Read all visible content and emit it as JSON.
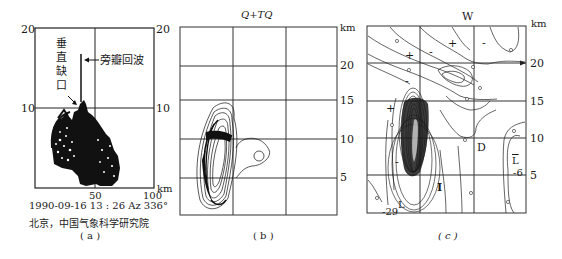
{
  "figure": {
    "panels": [
      {
        "id": "a",
        "caption": "( a )",
        "y_ticks_left": [
          "20",
          "10"
        ],
        "y_ticks_right": [
          "20",
          "10"
        ],
        "x_ticks": [
          "50",
          "100"
        ],
        "unit": "km",
        "annotations": {
          "vertical_notch": "垂直缺口",
          "vertical_notch_chars": [
            "垂",
            "直",
            "缺",
            "口"
          ],
          "sidelobe_echo": "旁瓣回波"
        },
        "timestamp": "1990-09-16  13 : 26 Az  336°",
        "source": "北京，中国气象科学研究院"
      },
      {
        "id": "b",
        "caption": "( b )",
        "title": "Q+TQ",
        "unit": "km",
        "y_ticks_right": [
          "20",
          "15",
          "10",
          "5"
        ]
      },
      {
        "id": "c",
        "caption": "( c )",
        "title": "W",
        "unit": "km",
        "y_ticks_right": [
          "20",
          "15",
          "10",
          "5"
        ],
        "markers": {
          "plus": "+",
          "minus": "-",
          "D": "D",
          "I": "I",
          "L_bar": "L",
          "L": "L",
          "value_neg6": "-6",
          "value_neg29": "-29"
        }
      }
    ]
  },
  "colors": {
    "ink": "#1a1a1a",
    "grid": "#333333",
    "background": "#ffffff"
  }
}
